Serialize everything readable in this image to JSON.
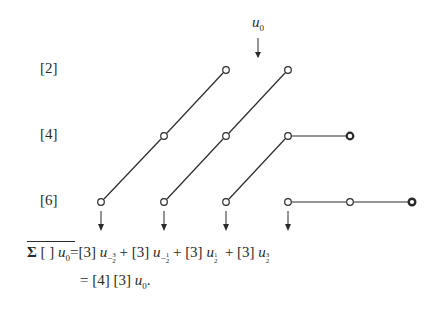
{
  "diagram": {
    "top_label": {
      "symbol": "u",
      "subscript": "0"
    },
    "row_labels": [
      "[2]",
      "[4]",
      "[6]"
    ],
    "rows": [
      {
        "label": "[2]",
        "y": 70,
        "nodes_x": [
          226,
          288
        ]
      },
      {
        "label": "[4]",
        "y": 136,
        "nodes_x": [
          164,
          226,
          288,
          350
        ]
      },
      {
        "label": "[6]",
        "y": 202,
        "nodes_x": [
          101,
          164,
          226,
          288,
          350,
          412
        ]
      }
    ],
    "down_arrows_x": [
      101,
      164,
      226,
      288
    ]
  },
  "equation": {
    "line1": {
      "lhs": {
        "sigma": "Σ",
        "bracket": "[ ]",
        "var": "u",
        "sub": "0"
      },
      "eq": "=",
      "terms": [
        {
          "coef": "[3]",
          "var": "u",
          "sub_sign": "−",
          "sub_num": "3",
          "sub_den": "2"
        },
        {
          "coef": "[3]",
          "var": "u",
          "sub_sign": "−",
          "sub_num": "1",
          "sub_den": "2"
        },
        {
          "coef": "[3]",
          "var": "u",
          "sub_sign": "",
          "sub_num": "1",
          "sub_den": "2"
        },
        {
          "coef": "[3]",
          "var": "u",
          "sub_sign": "",
          "sub_num": "3",
          "sub_den": "2"
        }
      ],
      "plus": "+"
    },
    "line2": {
      "eq": "=",
      "coef1": "[4]",
      "coef2": "[3]",
      "var": "u",
      "sub": "0",
      "end": "."
    }
  }
}
